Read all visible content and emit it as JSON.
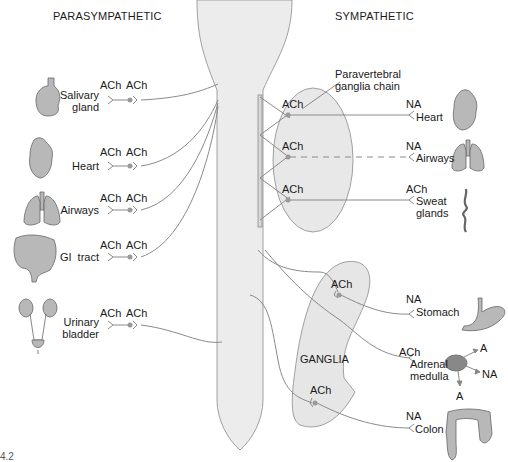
{
  "headers": {
    "parasympathetic": "PARASYMPATHETIC",
    "sympathetic": "SYMPATHETIC"
  },
  "parasympathetic": [
    {
      "organ": "Salivary",
      "organ2": "gland",
      "pre": "ACh",
      "post": "ACh"
    },
    {
      "organ": "Heart",
      "organ2": "",
      "pre": "ACh",
      "post": "ACh"
    },
    {
      "organ": "Airways",
      "organ2": "",
      "pre": "ACh",
      "post": "ACh"
    },
    {
      "organ": "GI  tract",
      "organ2": "",
      "pre": "ACh",
      "post": "ACh"
    },
    {
      "organ": "Urinary",
      "organ2": "bladder",
      "pre": "ACh",
      "post": "ACh"
    }
  ],
  "sympathetic_chain": {
    "label": "Paravertebral",
    "label2": "ganglia chain",
    "rows": [
      {
        "pre": "ACh",
        "post": "NA",
        "organ": "Heart",
        "organ2": "",
        "dashed": false
      },
      {
        "pre": "ACh",
        "post": "NA",
        "organ": "Airways",
        "organ2": "",
        "dashed": true
      },
      {
        "pre": "ACh",
        "post": "ACh",
        "organ": "Sweat",
        "organ2": "glands",
        "dashed": false
      }
    ]
  },
  "sympathetic_ganglia": {
    "label": "GANGLIA",
    "rows": [
      {
        "pre": "ACh",
        "post": "NA",
        "organ": "Stomach"
      },
      {
        "pre": "ACh",
        "post": "NA",
        "organ": "Colon"
      }
    ]
  },
  "adrenal": {
    "pre": "ACh",
    "organ": "Adrenal",
    "organ2": "medulla",
    "outputs": [
      "A",
      "NA",
      "A"
    ]
  },
  "figure_number": "4.2",
  "colors": {
    "line": "#8a8a8a",
    "cord_fill": "#ececec",
    "ganglia_fill": "#e6e6e6",
    "organ_fill": "#b8b8b8",
    "synapse_dot": "#9a9a9a",
    "text": "#1a1a1a"
  }
}
